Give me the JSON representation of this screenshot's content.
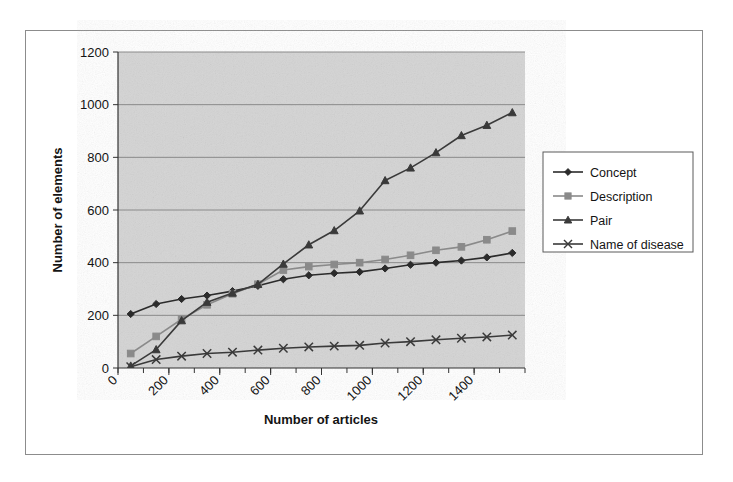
{
  "chart_data": {
    "type": "line",
    "title": "",
    "xlabel": "Number of articles",
    "ylabel": "Number of elements",
    "xlim": [
      0,
      1600
    ],
    "ylim": [
      0,
      1200
    ],
    "xticks": [
      0,
      200,
      400,
      600,
      800,
      1000,
      1200,
      1400
    ],
    "yticks": [
      0,
      200,
      400,
      600,
      800,
      1000,
      1200
    ],
    "xtick_labels": [
      "0",
      "200",
      "400",
      "600",
      "800",
      "1000",
      "1200",
      "1400"
    ],
    "ytick_labels": [
      "0",
      "200",
      "400",
      "600",
      "800",
      "1000",
      "1200"
    ],
    "xtick_rotation": 45,
    "grid": "horizontal",
    "legend_position": "right",
    "plot_background": "#d4d4d4",
    "x": [
      50,
      150,
      250,
      350,
      450,
      550,
      650,
      750,
      850,
      950,
      1050,
      1150,
      1250,
      1350,
      1450,
      1550
    ],
    "series": [
      {
        "name": "Concept",
        "marker": "diamond",
        "color": "#2b2b2b",
        "values": [
          205,
          243,
          262,
          275,
          292,
          312,
          337,
          352,
          360,
          365,
          378,
          392,
          400,
          408,
          420,
          437
        ]
      },
      {
        "name": "Description",
        "marker": "square",
        "color": "#8a8a8a",
        "values": [
          55,
          120,
          185,
          240,
          282,
          318,
          372,
          385,
          393,
          400,
          412,
          428,
          447,
          460,
          487,
          520
        ]
      },
      {
        "name": "Pair",
        "marker": "triangle",
        "color": "#3a3a3a",
        "values": [
          8,
          70,
          180,
          250,
          285,
          318,
          395,
          468,
          522,
          597,
          712,
          760,
          818,
          883,
          922,
          970
        ]
      },
      {
        "name": "Name of disease",
        "marker": "x",
        "color": "#3a3a3a",
        "values": [
          5,
          32,
          45,
          55,
          60,
          68,
          75,
          80,
          83,
          86,
          95,
          100,
          107,
          113,
          118,
          125
        ]
      }
    ]
  },
  "legend": {
    "entries": [
      {
        "label": "Concept"
      },
      {
        "label": "Description"
      },
      {
        "label": "Pair"
      },
      {
        "label": "Name of disease"
      }
    ]
  },
  "axes": {
    "x_title": "Number of articles",
    "y_title": "Number of elements"
  }
}
